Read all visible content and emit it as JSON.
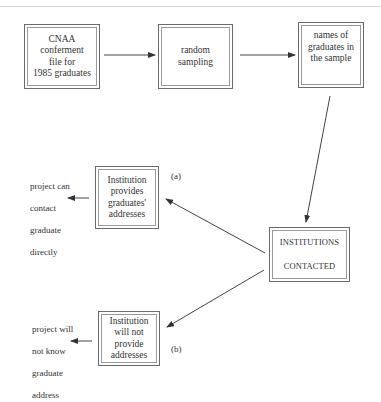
{
  "diagram": {
    "boxes": {
      "conferment_file": {
        "lines": [
          "CNAA",
          "conferment",
          "file for",
          "1985 graduates"
        ]
      },
      "random_sampling": {
        "lines": [
          "random",
          "sampling"
        ]
      },
      "names_of_graduates": {
        "lines": [
          "names of",
          "graduates in",
          "the sample"
        ]
      },
      "institution_provides": {
        "lines": [
          "Institution",
          "provides",
          "graduates'",
          "addresses"
        ]
      },
      "institution_will_not": {
        "lines": [
          "Institution",
          "will not",
          "provide",
          "addresses"
        ]
      },
      "institutions_contacted": {
        "lines": [
          "INSTITUTIONS",
          "CONTACTED"
        ]
      }
    },
    "outcomes": {
      "can_contact": {
        "lines": [
          "project can",
          "contact",
          "graduate",
          "directly"
        ]
      },
      "will_not_know": {
        "lines": [
          "project will",
          "not know",
          "graduate",
          "address"
        ]
      }
    },
    "branch_labels": {
      "a": "(a)",
      "b": "(b)"
    },
    "edges": [
      {
        "from": "conferment_file",
        "to": "random_sampling"
      },
      {
        "from": "random_sampling",
        "to": "names_of_graduates"
      },
      {
        "from": "names_of_graduates",
        "to": "institutions_contacted"
      },
      {
        "from": "institutions_contacted",
        "to": "institution_provides",
        "label": "(a)"
      },
      {
        "from": "institutions_contacted",
        "to": "institution_will_not",
        "label": "(b)"
      },
      {
        "from": "institution_provides",
        "to": "can_contact"
      },
      {
        "from": "institution_will_not",
        "to": "will_not_know"
      }
    ]
  }
}
